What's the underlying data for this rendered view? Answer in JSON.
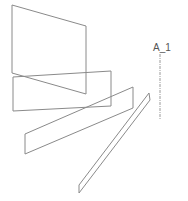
{
  "diagram": {
    "title": "",
    "shapes": [
      {
        "id": "plane-1",
        "points": "12,5 86,26 86,94 12,73"
      },
      {
        "id": "plane-2",
        "points": "13,77 111,71 111,106 13,111"
      },
      {
        "id": "plane-3",
        "points": "25,134 133,87 133,108 25,154"
      },
      {
        "id": "plane-4",
        "points": "149,93 150,100 79,193 79,185"
      }
    ],
    "axis": {
      "label": "A_1",
      "x": 160,
      "y1": 54,
      "y2": 120,
      "label_x": 155,
      "label_y": 50
    },
    "colors": {
      "stroke": "#8a8a8a",
      "label": "#555555",
      "background": "#ffffff"
    }
  }
}
